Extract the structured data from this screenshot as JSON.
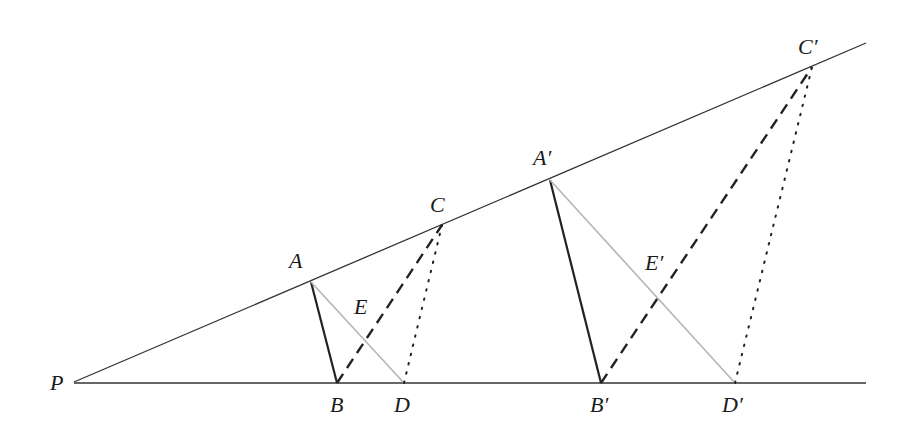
{
  "diagram": {
    "colors": {
      "ray": "#333333",
      "solid_segment": "#222222",
      "gray_segment": "#b5b5b5",
      "dashed_segment": "#222222",
      "dotted_segment": "#222222"
    },
    "points": {
      "P": {
        "label": "P",
        "x": 74,
        "y": 382
      },
      "A": {
        "label": "A",
        "x": 311,
        "y": 282
      },
      "B": {
        "label": "B",
        "x": 337,
        "y": 383
      },
      "C": {
        "label": "C",
        "x": 442,
        "y": 225
      },
      "D": {
        "label": "D",
        "x": 404,
        "y": 383
      },
      "E": {
        "label": "E",
        "x": 381,
        "y": 335
      },
      "A_prime": {
        "label": "A′",
        "x": 550,
        "y": 180
      },
      "B_prime": {
        "label": "B′",
        "x": 601,
        "y": 383
      },
      "C_prime": {
        "label": "C′",
        "x": 812,
        "y": 67
      },
      "D_prime": {
        "label": "D′",
        "x": 735,
        "y": 383
      },
      "E_prime": {
        "label": "E′",
        "x": 657,
        "y": 303
      }
    },
    "labels": [
      {
        "id": "P",
        "text": "P",
        "x": 50,
        "y": 390
      },
      {
        "id": "A",
        "text": "A",
        "x": 289,
        "y": 268
      },
      {
        "id": "B",
        "text": "B",
        "x": 330,
        "y": 412
      },
      {
        "id": "D",
        "text": "D",
        "x": 394,
        "y": 412
      },
      {
        "id": "C",
        "text": "C",
        "x": 430,
        "y": 212
      },
      {
        "id": "E",
        "text": "E",
        "x": 354,
        "y": 314
      },
      {
        "id": "A_prime",
        "text": "A′",
        "x": 533,
        "y": 165
      },
      {
        "id": "E_prime",
        "text": "E′",
        "x": 645,
        "y": 270
      },
      {
        "id": "B_prime",
        "text": "B′",
        "x": 590,
        "y": 412
      },
      {
        "id": "D_prime",
        "text": "D′",
        "x": 722,
        "y": 412
      },
      {
        "id": "C_prime",
        "text": "C′",
        "x": 798,
        "y": 54
      }
    ],
    "segments": [
      {
        "name": "upper-ray",
        "from": [
          74,
          382
        ],
        "to": [
          866,
          43
        ],
        "style": "ray"
      },
      {
        "name": "lower-ray",
        "from": [
          74,
          383
        ],
        "to": [
          866,
          383
        ],
        "style": "ray"
      },
      {
        "name": "segment-AB",
        "from": [
          311,
          282
        ],
        "to": [
          337,
          383
        ],
        "style": "solid"
      },
      {
        "name": "segment-AD",
        "from": [
          311,
          282
        ],
        "to": [
          404,
          383
        ],
        "style": "gray"
      },
      {
        "name": "segment-BC",
        "from": [
          337,
          383
        ],
        "to": [
          442,
          225
        ],
        "style": "dashed"
      },
      {
        "name": "segment-DC",
        "from": [
          404,
          383
        ],
        "to": [
          442,
          225
        ],
        "style": "dotted"
      },
      {
        "name": "segment-A'B'",
        "from": [
          550,
          180
        ],
        "to": [
          601,
          383
        ],
        "style": "solid"
      },
      {
        "name": "segment-A'D'",
        "from": [
          550,
          180
        ],
        "to": [
          735,
          383
        ],
        "style": "gray"
      },
      {
        "name": "segment-B'C'",
        "from": [
          601,
          383
        ],
        "to": [
          812,
          67
        ],
        "style": "dashed"
      },
      {
        "name": "segment-D'C'",
        "from": [
          735,
          383
        ],
        "to": [
          812,
          67
        ],
        "style": "dotted"
      }
    ]
  }
}
